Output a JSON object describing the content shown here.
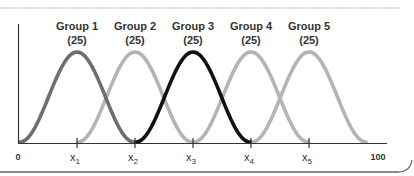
{
  "chart_data": {
    "type": "line",
    "title": "",
    "xlabel": "",
    "ylabel": "",
    "xlim": [
      0,
      100
    ],
    "grid": false,
    "legend": "none",
    "x_tick_labels": [
      "0",
      "x1",
      "x2",
      "x3",
      "x4",
      "x5",
      "100"
    ],
    "series": [
      {
        "name": "Group 1",
        "n": 25,
        "label": "Group 1",
        "count_label": "(25)",
        "center": "x1",
        "color": "#6e6e6e"
      },
      {
        "name": "Group 2",
        "n": 25,
        "label": "Group 2",
        "count_label": "(25)",
        "center": "x2",
        "color": "#b4b4b4"
      },
      {
        "name": "Group 3",
        "n": 25,
        "label": "Group 3",
        "count_label": "(25)",
        "center": "x3",
        "color": "#111111"
      },
      {
        "name": "Group 4",
        "n": 25,
        "label": "Group 4",
        "count_label": "(25)",
        "center": "x4",
        "color": "#b4b4b4"
      },
      {
        "name": "Group 5",
        "n": 25,
        "label": "Group 5",
        "count_label": "(25)",
        "center": "x5",
        "color": "#b4b4b4"
      }
    ],
    "annotations": [
      "Five overlapping bell-shaped distributions of equal size (n=25 each) centered at x1..x5"
    ]
  },
  "axis": {
    "zero": "0",
    "hundred": "100",
    "ticks": [
      {
        "base": "x",
        "sub": "1"
      },
      {
        "base": "x",
        "sub": "2"
      },
      {
        "base": "x",
        "sub": "3"
      },
      {
        "base": "x",
        "sub": "4"
      },
      {
        "base": "x",
        "sub": "5"
      }
    ]
  }
}
